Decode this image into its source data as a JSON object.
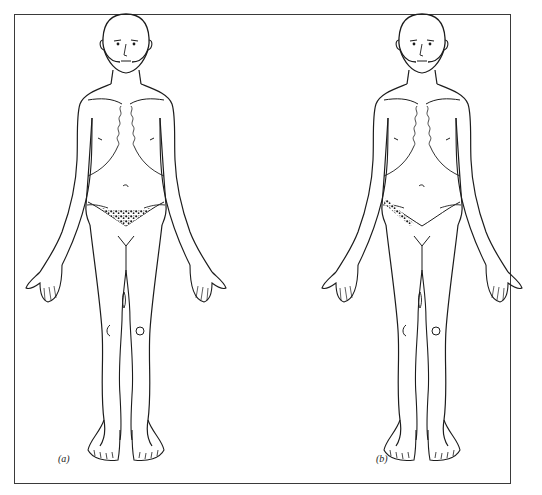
{
  "figure": {
    "panels": [
      {
        "id": "a",
        "label": "(a)",
        "view": "anterior full body",
        "shaded_region": "suprapubic / lower abdomen (central)",
        "shading_color": "#1a1a1a"
      },
      {
        "id": "b",
        "label": "(b)",
        "view": "anterior full body",
        "shaded_region": "right iliac fossa / inguinal band",
        "shading_color": "#1a1a1a"
      }
    ],
    "line_color": "#1c1c1c",
    "frame_color": "#3a3a3a",
    "background": "#ffffff"
  }
}
